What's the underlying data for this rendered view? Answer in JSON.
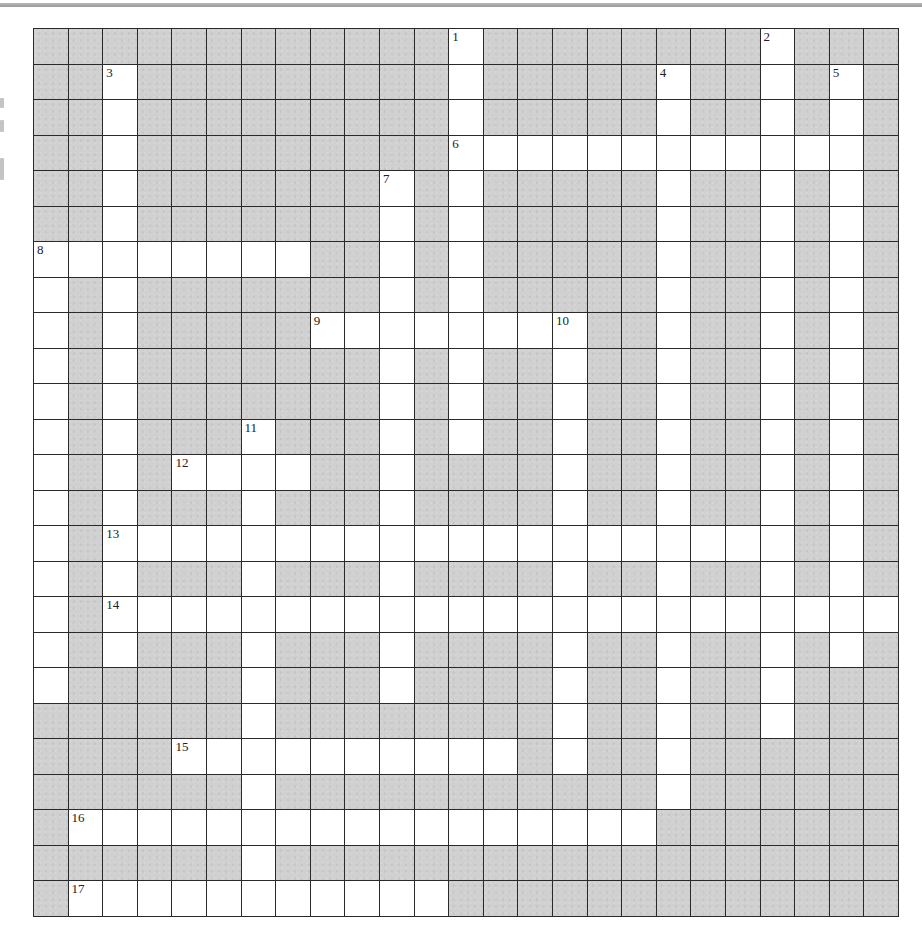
{
  "puzzle": {
    "rows": 25,
    "cols": 25,
    "colors": {
      "block": "#d0d0d0",
      "open": "#ffffff",
      "grid_line": "#2a2a2a",
      "label": "#222222"
    },
    "across": [
      {
        "number": 6,
        "row": 3,
        "col": 12,
        "length": 12
      },
      {
        "number": 8,
        "row": 6,
        "col": 0,
        "length": 8
      },
      {
        "number": 9,
        "row": 8,
        "col": 8,
        "length": 8
      },
      {
        "number": 12,
        "row": 12,
        "col": 4,
        "length": 4
      },
      {
        "number": 13,
        "row": 14,
        "col": 2,
        "length": 20
      },
      {
        "number": 14,
        "row": 16,
        "col": 2,
        "length": 23
      },
      {
        "number": 15,
        "row": 20,
        "col": 4,
        "length": 10
      },
      {
        "number": 16,
        "row": 22,
        "col": 1,
        "length": 17
      },
      {
        "number": 17,
        "row": 24,
        "col": 1,
        "length": 11
      }
    ],
    "down": [
      {
        "number": 1,
        "row": 0,
        "col": 12,
        "length": 12
      },
      {
        "number": 2,
        "row": 0,
        "col": 21,
        "length": 20
      },
      {
        "number": 3,
        "row": 1,
        "col": 2,
        "length": 17
      },
      {
        "number": 4,
        "row": 1,
        "col": 18,
        "length": 21
      },
      {
        "number": 5,
        "row": 1,
        "col": 23,
        "length": 17
      },
      {
        "number": 7,
        "row": 4,
        "col": 10,
        "length": 15
      },
      {
        "number": 8,
        "row": 6,
        "col": 0,
        "length": 13
      },
      {
        "number": 10,
        "row": 8,
        "col": 15,
        "length": 13
      },
      {
        "number": 11,
        "row": 11,
        "col": 6,
        "length": 14
      }
    ],
    "labels": [
      {
        "number": "1",
        "row": 0,
        "col": 12
      },
      {
        "number": "2",
        "row": 0,
        "col": 21
      },
      {
        "number": "3",
        "row": 1,
        "col": 2
      },
      {
        "number": "4",
        "row": 1,
        "col": 18
      },
      {
        "number": "5",
        "row": 1,
        "col": 23
      },
      {
        "number": "6",
        "row": 3,
        "col": 12
      },
      {
        "number": "7",
        "row": 4,
        "col": 10
      },
      {
        "number": "8",
        "row": 6,
        "col": 0
      },
      {
        "number": "9",
        "row": 8,
        "col": 8
      },
      {
        "number": "10",
        "row": 8,
        "col": 15
      },
      {
        "number": "11",
        "row": 11,
        "col": 6
      },
      {
        "number": "12",
        "row": 12,
        "col": 4
      },
      {
        "number": "13",
        "row": 14,
        "col": 2
      },
      {
        "number": "14",
        "row": 16,
        "col": 2
      },
      {
        "number": "15",
        "row": 20,
        "col": 4
      },
      {
        "number": "16",
        "row": 22,
        "col": 1
      },
      {
        "number": "17",
        "row": 24,
        "col": 1
      }
    ]
  }
}
